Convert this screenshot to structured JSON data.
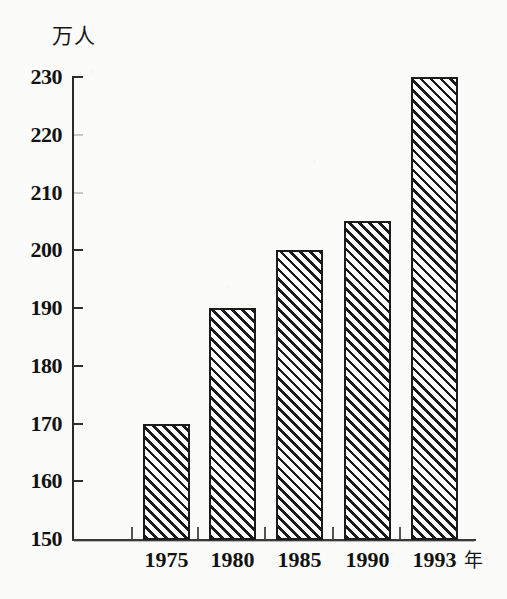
{
  "chart_data": {
    "type": "bar",
    "title": "",
    "subtitle": "",
    "xlabel": "年",
    "ylabel": "万人",
    "categories": [
      "1975",
      "1980",
      "1985",
      "1990",
      "1993"
    ],
    "values": [
      170,
      190,
      200,
      205,
      230
    ],
    "ylim": [
      150,
      230
    ],
    "yticks": [
      150,
      160,
      170,
      180,
      190,
      200,
      210,
      220,
      230
    ],
    "ytick_labels": [
      "150",
      "160",
      "170",
      "180",
      "190",
      "200",
      "210",
      "220",
      "230"
    ],
    "grid": false,
    "legend": null,
    "annotations": [],
    "bar_fill": "diagonal-hatch",
    "colors": {
      "ink": "#1b1b1b",
      "axis": "#2a2a2a",
      "paper": "#fbfbf9"
    }
  },
  "axes": {
    "y_unit_label": "万人",
    "x_unit_label": "年"
  }
}
